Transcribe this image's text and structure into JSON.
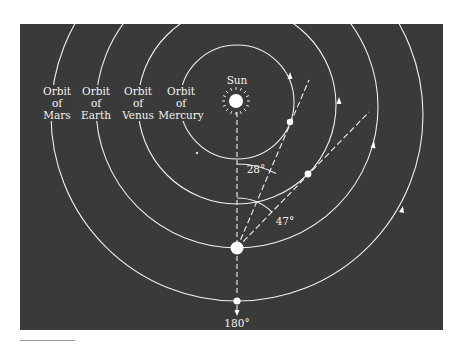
{
  "figure": {
    "background_color": "#3a3a3a",
    "line_color": "#f0f0f0",
    "labels": {
      "sun": "Sun",
      "orbits": [
        {
          "line1": "Orbit",
          "line2": "of",
          "line3": "Mars",
          "x": 57
        },
        {
          "line1": "Orbit",
          "line2": "of",
          "line3": "Earth",
          "x": 96
        },
        {
          "line1": "Orbit",
          "line2": "of",
          "line3": "Venus",
          "x": 138
        },
        {
          "line1": "Orbit",
          "line2": "of",
          "line3": "Mercury",
          "x": 181
        }
      ],
      "angle_28": "28°",
      "angle_47": "47°",
      "angle_180": "180°"
    },
    "bodies": {
      "sun": {
        "x": 236,
        "y": 101
      },
      "earth": {
        "x": 237,
        "y": 248
      },
      "mercury": {
        "x": 290,
        "y": 122
      },
      "venus": {
        "x": 308,
        "y": 174
      },
      "mars": {
        "x": 237,
        "y": 301
      }
    },
    "angles_deg": [
      28,
      47,
      180
    ]
  }
}
